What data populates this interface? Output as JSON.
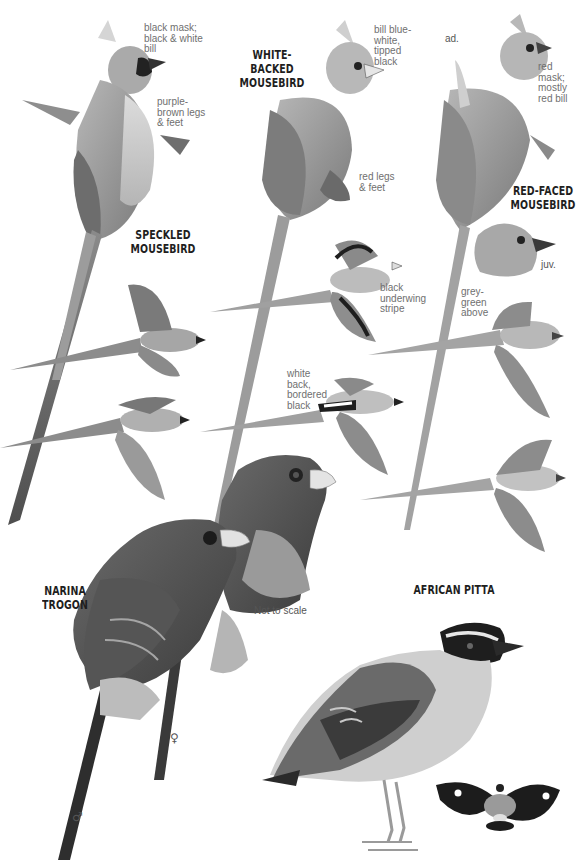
{
  "plate": {
    "species": [
      {
        "name": "SPECKLED\nMOUSEBIRD",
        "annotations": [
          "black mask;\nblack & white\nbill",
          "purple-\nbrown legs\n& feet"
        ]
      },
      {
        "name": "WHITE-BACKED\nMOUSEBIRD",
        "annotations": [
          "bill blue-\nwhite,\ntipped\nblack",
          "red legs\n& feet",
          "black\nunderwing\nstripe",
          "white\nback,\nbordered\nblack"
        ]
      },
      {
        "name": "RED-FACED\nMOUSEBIRD",
        "annotations": [
          "red mask;\nmostly\nred bill",
          "grey-\ngreen\nabove"
        ],
        "age_labels": [
          "ad.",
          "juv."
        ]
      },
      {
        "name": "NARINA\nTROGON",
        "sex_labels": [
          "♀",
          "♂"
        ],
        "note": "Not to scale"
      },
      {
        "name": "AFRICAN PITTA"
      }
    ]
  },
  "colors": {
    "background": "#ffffff",
    "title_text": "#1e1e1e",
    "annotation_text": "#6f6f6f",
    "bird_mid": "#9a9a9a",
    "bird_dark": "#3a3a3a",
    "bird_light": "#d6d6d6"
  }
}
